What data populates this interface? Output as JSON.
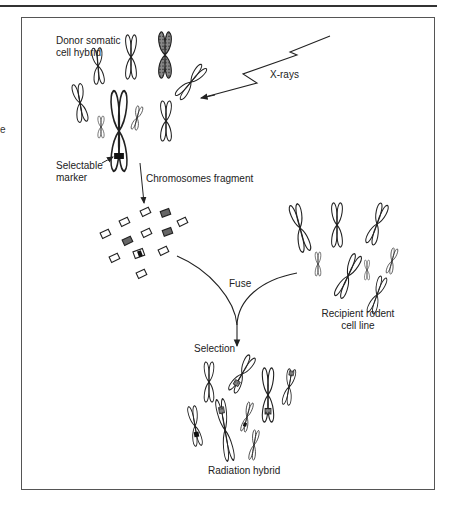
{
  "figure": {
    "labels": {
      "donor": "Donor somatic\ncell hybrid",
      "donor_line1": "Donor somatic",
      "donor_line2": "cell hybrid",
      "xrays": "X-rays",
      "marker_line1": "Selectable",
      "marker_line2": "marker",
      "fragment": "Chromosomes fragment",
      "fuse": "Fuse",
      "recipient_line1": "Recipient rodent",
      "recipient_line2": "cell line",
      "selection": "Selection",
      "result": "Radiation hybrid",
      "side_fragment": "e"
    },
    "colors": {
      "line": "#222222",
      "frame": "#555555",
      "background": "#ffffff"
    }
  }
}
